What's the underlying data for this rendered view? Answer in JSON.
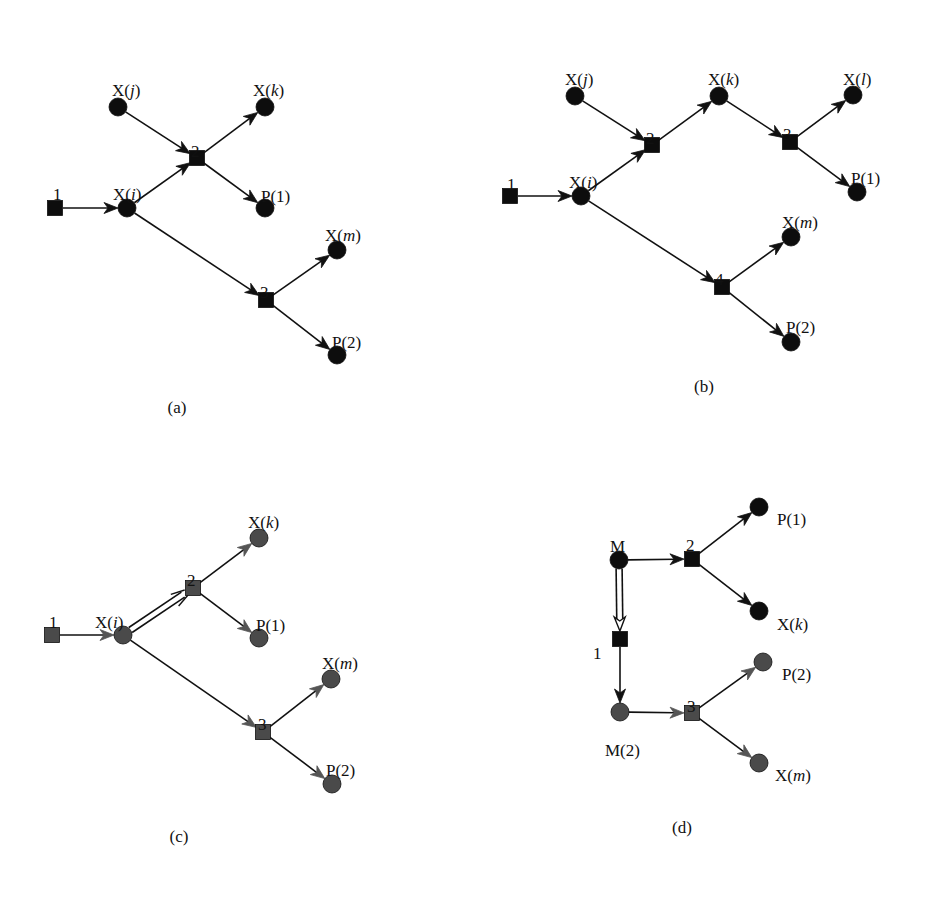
{
  "figure": {
    "panels": [
      {
        "id": "a",
        "caption": "(a)",
        "caption_pos": [
          177,
          413
        ],
        "style": "black",
        "nodes": [
          {
            "id": "r1",
            "kind": "reaction",
            "label": "1",
            "x": 55,
            "y": 208,
            "lx": 53,
            "ly": 186
          },
          {
            "id": "Xi",
            "kind": "species",
            "label": "X(i)",
            "x": 127,
            "y": 208,
            "lx": 113,
            "ly": 186
          },
          {
            "id": "Xj",
            "kind": "species",
            "label": "X(j)",
            "x": 118,
            "y": 107,
            "lx": 112,
            "ly": 82
          },
          {
            "id": "r2",
            "kind": "reaction",
            "label": "2",
            "x": 197,
            "y": 158,
            "lx": 191,
            "ly": 143
          },
          {
            "id": "Xk",
            "kind": "species",
            "label": "X(k)",
            "x": 265,
            "y": 107,
            "lx": 253,
            "ly": 82
          },
          {
            "id": "P1",
            "kind": "species",
            "label": "P(1)",
            "x": 265,
            "y": 208,
            "lx": 261,
            "ly": 188
          },
          {
            "id": "r3",
            "kind": "reaction",
            "label": "3",
            "x": 266,
            "y": 300,
            "lx": 260,
            "ly": 284
          },
          {
            "id": "Xm",
            "kind": "species",
            "label": "X(m)",
            "x": 337,
            "y": 250,
            "lx": 325,
            "ly": 227
          },
          {
            "id": "P2",
            "kind": "species",
            "label": "P(2)",
            "x": 337,
            "y": 355,
            "lx": 332,
            "ly": 334
          }
        ],
        "edges": [
          {
            "from": "r1",
            "to": "Xi",
            "type": "arrow"
          },
          {
            "from": "Xj",
            "to": "r2",
            "type": "arrow"
          },
          {
            "from": "Xi",
            "to": "r2",
            "type": "arrow"
          },
          {
            "from": "r2",
            "to": "Xk",
            "type": "arrow"
          },
          {
            "from": "r2",
            "to": "P1",
            "type": "arrow"
          },
          {
            "from": "Xi",
            "to": "r3",
            "type": "arrow"
          },
          {
            "from": "r3",
            "to": "Xm",
            "type": "arrow"
          },
          {
            "from": "r3",
            "to": "P2",
            "type": "arrow"
          }
        ]
      },
      {
        "id": "b",
        "caption": "(b)",
        "caption_pos": [
          704,
          392
        ],
        "style": "black",
        "nodes": [
          {
            "id": "r1",
            "kind": "reaction",
            "label": "1",
            "x": 510,
            "y": 196,
            "lx": 507,
            "ly": 176
          },
          {
            "id": "Xi",
            "kind": "species",
            "label": "X(i)",
            "x": 581,
            "y": 196,
            "lx": 569,
            "ly": 174
          },
          {
            "id": "Xj",
            "kind": "species",
            "label": "X(j)",
            "x": 575,
            "y": 96,
            "lx": 565,
            "ly": 71
          },
          {
            "id": "r2",
            "kind": "reaction",
            "label": "2",
            "x": 652,
            "y": 145,
            "lx": 646,
            "ly": 130
          },
          {
            "id": "Xk",
            "kind": "species",
            "label": "X(k)",
            "x": 719,
            "y": 96,
            "lx": 708,
            "ly": 71
          },
          {
            "id": "r3",
            "kind": "reaction",
            "label": "3",
            "x": 790,
            "y": 142,
            "lx": 783,
            "ly": 126
          },
          {
            "id": "Xl",
            "kind": "species",
            "label": "X(l)",
            "x": 853,
            "y": 95,
            "lx": 843,
            "ly": 71
          },
          {
            "id": "P1",
            "kind": "species",
            "label": "P(1)",
            "x": 857,
            "y": 192,
            "lx": 851,
            "ly": 170
          },
          {
            "id": "r4",
            "kind": "reaction",
            "label": "4",
            "x": 722,
            "y": 287,
            "lx": 715,
            "ly": 271
          },
          {
            "id": "Xm",
            "kind": "species",
            "label": "X(m)",
            "x": 791,
            "y": 237,
            "lx": 782,
            "ly": 214
          },
          {
            "id": "P2",
            "kind": "species",
            "label": "P(2)",
            "x": 791,
            "y": 342,
            "lx": 786,
            "ly": 319
          }
        ],
        "edges": [
          {
            "from": "r1",
            "to": "Xi",
            "type": "arrow"
          },
          {
            "from": "Xj",
            "to": "r2",
            "type": "arrow"
          },
          {
            "from": "Xi",
            "to": "r2",
            "type": "arrow"
          },
          {
            "from": "r2",
            "to": "Xk",
            "type": "arrow"
          },
          {
            "from": "Xk",
            "to": "r3",
            "type": "arrow"
          },
          {
            "from": "r3",
            "to": "Xl",
            "type": "arrow"
          },
          {
            "from": "r3",
            "to": "P1",
            "type": "arrow"
          },
          {
            "from": "Xi",
            "to": "r4",
            "type": "arrow"
          },
          {
            "from": "r4",
            "to": "Xm",
            "type": "arrow"
          },
          {
            "from": "r4",
            "to": "P2",
            "type": "arrow"
          }
        ]
      },
      {
        "id": "c",
        "caption": "(c)",
        "caption_pos": [
          179,
          842
        ],
        "style": "gray",
        "nodes": [
          {
            "id": "r1",
            "kind": "reaction",
            "label": "1",
            "x": 52,
            "y": 635,
            "lx": 49,
            "ly": 614
          },
          {
            "id": "Xi",
            "kind": "species",
            "label": "X(i)",
            "x": 123,
            "y": 635,
            "lx": 95,
            "ly": 614
          },
          {
            "id": "r2",
            "kind": "reaction",
            "label": "2",
            "x": 193,
            "y": 588,
            "lx": 187,
            "ly": 572
          },
          {
            "id": "Xk",
            "kind": "species",
            "label": "X(k)",
            "x": 259,
            "y": 538,
            "lx": 248,
            "ly": 514
          },
          {
            "id": "P1",
            "kind": "species",
            "label": "P(1)",
            "x": 259,
            "y": 638,
            "lx": 256,
            "ly": 617
          },
          {
            "id": "r3",
            "kind": "reaction",
            "label": "3",
            "x": 263,
            "y": 732,
            "lx": 258,
            "ly": 716
          },
          {
            "id": "Xm",
            "kind": "species",
            "label": "X(m)",
            "x": 331,
            "y": 679,
            "lx": 322,
            "ly": 655
          },
          {
            "id": "P2",
            "kind": "species",
            "label": "P(2)",
            "x": 332,
            "y": 784,
            "lx": 326,
            "ly": 762
          }
        ],
        "edges": [
          {
            "from": "r1",
            "to": "Xi",
            "type": "arrow"
          },
          {
            "from": "Xi",
            "to": "r2",
            "type": "double-arrow"
          },
          {
            "from": "r2",
            "to": "Xk",
            "type": "arrow"
          },
          {
            "from": "r2",
            "to": "P1",
            "type": "arrow"
          },
          {
            "from": "Xi",
            "to": "r3",
            "type": "arrow"
          },
          {
            "from": "r3",
            "to": "Xm",
            "type": "arrow"
          },
          {
            "from": "r3",
            "to": "P2",
            "type": "arrow"
          }
        ]
      },
      {
        "id": "d",
        "caption": "(d)",
        "caption_pos": [
          682,
          833
        ],
        "style": "mixed",
        "nodes": [
          {
            "id": "M",
            "kind": "species",
            "label": "M",
            "x": 619,
            "y": 560,
            "lx": 610,
            "ly": 538,
            "shade": "black"
          },
          {
            "id": "r2",
            "kind": "reaction",
            "label": "2",
            "x": 692,
            "y": 559,
            "lx": 686,
            "ly": 537,
            "shade": "black"
          },
          {
            "id": "P1",
            "kind": "species",
            "label": "P(1)",
            "x": 759,
            "y": 507,
            "lx": 777,
            "ly": 511,
            "shade": "black"
          },
          {
            "id": "Xk",
            "kind": "species",
            "label": "X(k)",
            "x": 759,
            "y": 611,
            "lx": 777,
            "ly": 616,
            "shade": "black"
          },
          {
            "id": "r1",
            "kind": "reaction",
            "label": "1",
            "x": 620,
            "y": 639,
            "lx": 593,
            "ly": 645,
            "shade": "black"
          },
          {
            "id": "M2",
            "kind": "species",
            "label": "M(2)",
            "x": 620,
            "y": 712,
            "lx": 605,
            "ly": 742,
            "shade": "gray"
          },
          {
            "id": "r3",
            "kind": "reaction",
            "label": "3",
            "x": 692,
            "y": 713,
            "lx": 687,
            "ly": 698,
            "shade": "gray"
          },
          {
            "id": "P2",
            "kind": "species",
            "label": "P(2)",
            "x": 763,
            "y": 662,
            "lx": 782,
            "ly": 666,
            "shade": "gray"
          },
          {
            "id": "Xm",
            "kind": "species",
            "label": "X(m)",
            "x": 759,
            "y": 763,
            "lx": 775,
            "ly": 767,
            "shade": "gray"
          }
        ],
        "edges": [
          {
            "from": "M",
            "to": "r2",
            "type": "arrow",
            "shade": "black"
          },
          {
            "from": "r2",
            "to": "P1",
            "type": "arrow",
            "shade": "black"
          },
          {
            "from": "r2",
            "to": "Xk",
            "type": "arrow",
            "shade": "black"
          },
          {
            "from": "M",
            "to": "r1",
            "type": "hollow-arrow",
            "shade": "black"
          },
          {
            "from": "r1",
            "to": "M2",
            "type": "arrow",
            "shade": "black"
          },
          {
            "from": "M2",
            "to": "r3",
            "type": "arrow",
            "shade": "gray"
          },
          {
            "from": "r3",
            "to": "P2",
            "type": "arrow",
            "shade": "gray"
          },
          {
            "from": "r3",
            "to": "Xm",
            "type": "arrow",
            "shade": "gray"
          }
        ]
      }
    ],
    "colors": {
      "black_fill": "#0d0d0d",
      "gray_fill": "#4a4a4a",
      "gray_arrowhead": "#555555",
      "edge": "#111111",
      "background": "#ffffff"
    }
  }
}
